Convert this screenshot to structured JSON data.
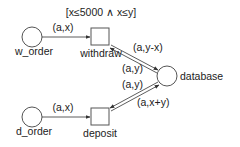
{
  "diagram": {
    "type": "petri-net",
    "places": [
      {
        "id": "w_order",
        "label": "w_order"
      },
      {
        "id": "d_order",
        "label": "d_order"
      },
      {
        "id": "database",
        "label": "database"
      }
    ],
    "transitions": [
      {
        "id": "withdraw",
        "label": "withdraw",
        "guard": "[x≤5000 ∧ x≤y]"
      },
      {
        "id": "deposit",
        "label": "deposit"
      }
    ],
    "arcs": [
      {
        "from": "w_order",
        "to": "withdraw",
        "label": "(a,x)"
      },
      {
        "from": "withdraw",
        "to": "database",
        "label": "(a,y-x)"
      },
      {
        "from": "database",
        "to": "withdraw",
        "label": "(a,y)"
      },
      {
        "from": "database",
        "to": "deposit",
        "label": "(a,y)"
      },
      {
        "from": "deposit",
        "to": "database",
        "label": "(a,x+y)"
      },
      {
        "from": "d_order",
        "to": "deposit",
        "label": "(a,x)"
      }
    ]
  }
}
